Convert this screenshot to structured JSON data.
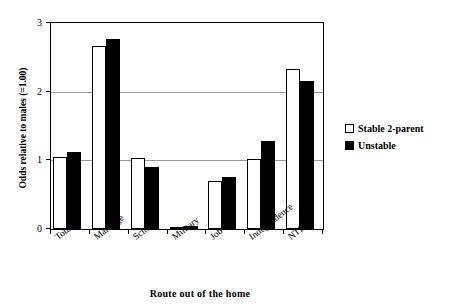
{
  "chart_data": {
    "type": "bar",
    "title": "",
    "subtitle": "",
    "xlabel": "Route out of the home",
    "ylabel": "Odds relative to males (=1.00)",
    "categories": [
      "Total",
      "Marriage",
      "School",
      "Military",
      "Job",
      "Independence",
      "NTF(a)"
    ],
    "series": [
      {
        "name": "Stable 2-parent",
        "color": "#ffffff",
        "edge_color": "#000000",
        "values": [
          1.05,
          2.67,
          1.03,
          0.02,
          0.7,
          1.02,
          2.33
        ]
      },
      {
        "name": "Unstable",
        "color": "#000000",
        "edge_color": "#000000",
        "values": [
          1.12,
          2.77,
          0.9,
          0.04,
          0.76,
          1.28,
          2.16
        ]
      }
    ],
    "ylim": [
      0,
      3
    ],
    "yticks": [
      "0",
      "1",
      "2",
      "3"
    ],
    "ytick_values": [
      0,
      1,
      2,
      3
    ],
    "gridlines_at": [
      1,
      2
    ],
    "grid": true,
    "legend_position": "right"
  },
  "legend": {
    "entries": [
      {
        "label": "Stable 2-parent",
        "swatch": "white-square"
      },
      {
        "label": "Unstable",
        "swatch": "black-square"
      }
    ]
  }
}
